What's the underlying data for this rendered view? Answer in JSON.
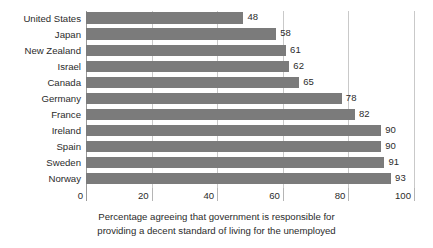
{
  "chart_data": {
    "type": "bar",
    "orientation": "horizontal",
    "title": "",
    "subtitle": "",
    "xlabel": "",
    "ylabel": "",
    "caption_line1": "Percentage agreeing that government is responsible for",
    "caption_line2": "providing a decent standard of living for the unemployed",
    "categories": [
      "United States",
      "Japan",
      "New Zealand",
      "Israel",
      "Canada",
      "Germany",
      "France",
      "Ireland",
      "Spain",
      "Sweden",
      "Norway"
    ],
    "values": [
      48,
      58,
      61,
      62,
      65,
      78,
      82,
      90,
      90,
      91,
      93
    ],
    "data_labels": [
      "48",
      "58",
      "61",
      "62",
      "65",
      "78",
      "82",
      "90",
      "90",
      "91",
      "93"
    ],
    "xlim": [
      0,
      100
    ],
    "xticks": [
      0,
      20,
      40,
      60,
      80,
      100
    ],
    "xtick_labels": [
      "0",
      "20",
      "40",
      "60",
      "80",
      "100"
    ],
    "grid": true,
    "grid_axis": "x",
    "legend": null,
    "bar_color": "#7b7b7b",
    "grid_color": "#c9c9c9",
    "axis_color": "#9a9a9a",
    "text_color": "#2b2b2b",
    "background_color": "#ffffff"
  }
}
